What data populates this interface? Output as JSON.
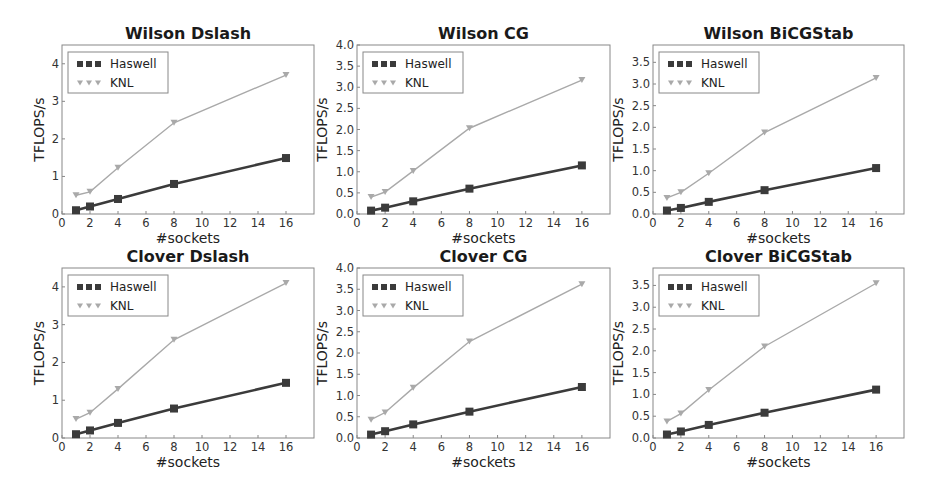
{
  "colors": {
    "haswell": "#3b3b3b",
    "knl": "#a9a9a9",
    "frame": "#888888"
  },
  "chart_data": [
    {
      "type": "line",
      "title": "Wilson Dslash",
      "xlabel": "#sockets",
      "ylabel": "TFLOPS/s",
      "x": [
        1,
        2,
        4,
        8,
        16
      ],
      "xlim": [
        0,
        18
      ],
      "xticks": [
        "0",
        "2",
        "4",
        "6",
        "8",
        "10",
        "12",
        "14",
        "16"
      ],
      "ylim": [
        0,
        4.5
      ],
      "yticks": [
        "0",
        "1",
        "2",
        "3",
        "4"
      ],
      "legend_position": "upper left",
      "grid": false,
      "series": [
        {
          "name": "Haswell",
          "marker": "square",
          "values": [
            0.1,
            0.2,
            0.4,
            0.8,
            1.49
          ]
        },
        {
          "name": "KNL",
          "marker": "triangle-down",
          "values": [
            0.5,
            0.59,
            1.23,
            2.43,
            3.7
          ]
        }
      ]
    },
    {
      "type": "line",
      "title": "Wilson CG",
      "xlabel": "#sockets",
      "ylabel": "TFLOPS/s",
      "x": [
        1,
        2,
        4,
        8,
        16
      ],
      "xlim": [
        0,
        18
      ],
      "xticks": [
        "0",
        "2",
        "4",
        "6",
        "8",
        "10",
        "12",
        "14",
        "16"
      ],
      "ylim": [
        0,
        4.0
      ],
      "yticks": [
        "0.0",
        "0.5",
        "1.0",
        "1.5",
        "2.0",
        "2.5",
        "3.0",
        "3.5",
        "4.0"
      ],
      "legend_position": "upper left",
      "grid": false,
      "series": [
        {
          "name": "Haswell",
          "marker": "square",
          "values": [
            0.08,
            0.15,
            0.3,
            0.6,
            1.15
          ]
        },
        {
          "name": "KNL",
          "marker": "triangle-down",
          "values": [
            0.4,
            0.52,
            1.02,
            2.03,
            3.17
          ]
        }
      ]
    },
    {
      "type": "line",
      "title": "Wilson BiCGStab",
      "xlabel": "#sockets",
      "ylabel": "TFLOPS/s",
      "x": [
        1,
        2,
        4,
        8,
        16
      ],
      "xlim": [
        0,
        18
      ],
      "xticks": [
        "0",
        "2",
        "4",
        "6",
        "8",
        "10",
        "12",
        "14",
        "16"
      ],
      "ylim": [
        0,
        3.9
      ],
      "yticks": [
        "0.0",
        "0.5",
        "1.0",
        "1.5",
        "2.0",
        "2.5",
        "3.0",
        "3.5"
      ],
      "legend_position": "upper left",
      "grid": false,
      "series": [
        {
          "name": "Haswell",
          "marker": "square",
          "values": [
            0.08,
            0.14,
            0.28,
            0.55,
            1.06
          ]
        },
        {
          "name": "KNL",
          "marker": "triangle-down",
          "values": [
            0.37,
            0.5,
            0.94,
            1.88,
            3.14
          ]
        }
      ]
    },
    {
      "type": "line",
      "title": "Clover Dslash",
      "xlabel": "#sockets",
      "ylabel": "TFLOPS/s",
      "x": [
        1,
        2,
        4,
        8,
        16
      ],
      "xlim": [
        0,
        18
      ],
      "xticks": [
        "0",
        "2",
        "4",
        "6",
        "8",
        "10",
        "12",
        "14",
        "16"
      ],
      "ylim": [
        0,
        4.5
      ],
      "yticks": [
        "0",
        "1",
        "2",
        "3",
        "4"
      ],
      "legend_position": "upper left",
      "grid": false,
      "series": [
        {
          "name": "Haswell",
          "marker": "square",
          "values": [
            0.1,
            0.2,
            0.4,
            0.78,
            1.46
          ]
        },
        {
          "name": "KNL",
          "marker": "triangle-down",
          "values": [
            0.5,
            0.67,
            1.3,
            2.6,
            4.1
          ]
        }
      ]
    },
    {
      "type": "line",
      "title": "Clover CG",
      "xlabel": "#sockets",
      "ylabel": "TFLOPS/s",
      "x": [
        1,
        2,
        4,
        8,
        16
      ],
      "xlim": [
        0,
        18
      ],
      "xticks": [
        "0",
        "2",
        "4",
        "6",
        "8",
        "10",
        "12",
        "14",
        "16"
      ],
      "ylim": [
        0,
        4.0
      ],
      "yticks": [
        "0.0",
        "0.5",
        "1.0",
        "1.5",
        "2.0",
        "2.5",
        "3.0",
        "3.5",
        "4.0"
      ],
      "legend_position": "upper left",
      "grid": false,
      "series": [
        {
          "name": "Haswell",
          "marker": "square",
          "values": [
            0.08,
            0.16,
            0.32,
            0.62,
            1.2
          ]
        },
        {
          "name": "KNL",
          "marker": "triangle-down",
          "values": [
            0.43,
            0.6,
            1.18,
            2.27,
            3.62
          ]
        }
      ]
    },
    {
      "type": "line",
      "title": "Clover BiCGStab",
      "xlabel": "#sockets",
      "ylabel": "TFLOPS/s",
      "x": [
        1,
        2,
        4,
        8,
        16
      ],
      "xlim": [
        0,
        18
      ],
      "xticks": [
        "0",
        "2",
        "4",
        "6",
        "8",
        "10",
        "12",
        "14",
        "16"
      ],
      "ylim": [
        0,
        3.9
      ],
      "yticks": [
        "0.0",
        "0.5",
        "1.0",
        "1.5",
        "2.0",
        "2.5",
        "3.0",
        "3.5"
      ],
      "legend_position": "upper left",
      "grid": false,
      "series": [
        {
          "name": "Haswell",
          "marker": "square",
          "values": [
            0.08,
            0.15,
            0.3,
            0.58,
            1.11
          ]
        },
        {
          "name": "KNL",
          "marker": "triangle-down",
          "values": [
            0.38,
            0.56,
            1.1,
            2.1,
            3.55
          ]
        }
      ]
    }
  ]
}
